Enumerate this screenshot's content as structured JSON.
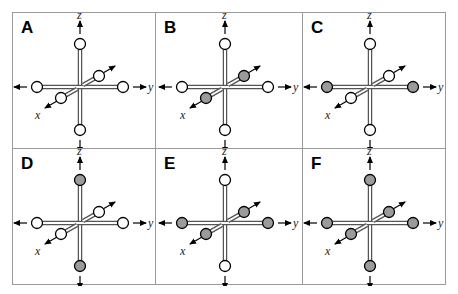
{
  "figure": {
    "colors": {
      "empty_site": "#ffffff",
      "filled_site": "#9b9b9b",
      "outline": "#000000",
      "border": "#9a9a9a"
    },
    "axis_labels": {
      "x": "x",
      "y": "y",
      "z": "z"
    },
    "panels": [
      {
        "label": "A",
        "sites": {
          "z_pos": "empty",
          "z_neg": "empty",
          "y_pos": "empty",
          "y_neg": "empty",
          "x_pos": "empty",
          "x_neg": "empty"
        }
      },
      {
        "label": "B",
        "sites": {
          "z_pos": "empty",
          "z_neg": "empty",
          "y_pos": "empty",
          "y_neg": "empty",
          "x_pos": "filled",
          "x_neg": "filled"
        }
      },
      {
        "label": "C",
        "sites": {
          "z_pos": "empty",
          "z_neg": "empty",
          "y_pos": "filled",
          "y_neg": "filled",
          "x_pos": "empty",
          "x_neg": "empty"
        }
      },
      {
        "label": "D",
        "sites": {
          "z_pos": "filled",
          "z_neg": "filled",
          "y_pos": "empty",
          "y_neg": "empty",
          "x_pos": "empty",
          "x_neg": "empty"
        }
      },
      {
        "label": "E",
        "sites": {
          "z_pos": "empty",
          "z_neg": "empty",
          "y_pos": "filled",
          "y_neg": "filled",
          "x_pos": "filled",
          "x_neg": "filled"
        }
      },
      {
        "label": "F",
        "sites": {
          "z_pos": "filled",
          "z_neg": "filled",
          "y_pos": "filled",
          "y_neg": "filled",
          "x_pos": "filled",
          "x_neg": "filled"
        }
      }
    ]
  }
}
